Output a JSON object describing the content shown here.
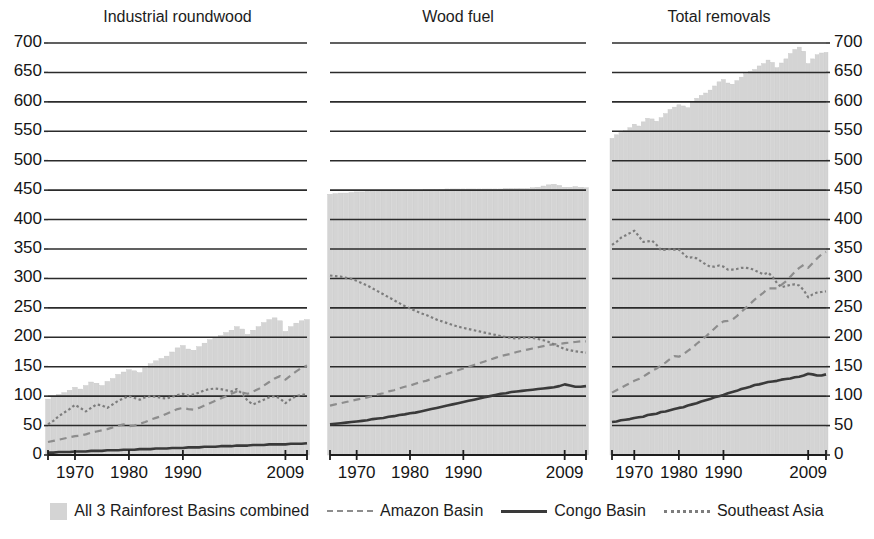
{
  "figure": {
    "width": 874,
    "height": 539,
    "background": "#ffffff"
  },
  "axes": {
    "y_ticks": [
      0,
      50,
      100,
      150,
      200,
      250,
      300,
      350,
      400,
      450,
      500,
      550,
      600,
      650,
      700
    ],
    "y_min": 0,
    "y_max": 700,
    "x_ticks": [
      "1970",
      "1980",
      "1990",
      "2009"
    ],
    "x_tick_years": [
      1970,
      1980,
      1990,
      2009
    ],
    "x_min": 1965,
    "x_max": 2013,
    "grid": true,
    "left_axis_shown": true,
    "right_axis_shown": true
  },
  "legend": {
    "position": "bottom-center",
    "items": [
      {
        "label": "All 3 Rainforest Basins combined",
        "marker": "area",
        "color": "#d4d4d4"
      },
      {
        "label": "Amazon Basin",
        "marker": "dashed",
        "color": "#8d8d8d"
      },
      {
        "label": "Congo Basin",
        "marker": "solid",
        "color": "#3a3a3a"
      },
      {
        "label": "Southeast Asia",
        "marker": "dotted",
        "color": "#7d7d7d"
      }
    ]
  },
  "chart_data": {
    "type": "line",
    "title": "",
    "xlabel": "",
    "ylabel": "",
    "ylim": [
      0,
      700
    ],
    "xlim": [
      1965,
      2013
    ],
    "grid": true,
    "legend_position": "bottom",
    "panels": [
      {
        "title": "Industrial roundwood",
        "x": [
          1965,
          1966,
          1967,
          1968,
          1969,
          1970,
          1971,
          1972,
          1973,
          1974,
          1975,
          1976,
          1977,
          1978,
          1979,
          1980,
          1981,
          1982,
          1983,
          1984,
          1985,
          1986,
          1987,
          1988,
          1989,
          1990,
          1991,
          1992,
          1993,
          1994,
          1995,
          1996,
          1997,
          1998,
          1999,
          2000,
          2001,
          2002,
          2003,
          2004,
          2005,
          2006,
          2007,
          2008,
          2009,
          2010,
          2011,
          2012,
          2013
        ],
        "series": [
          {
            "name": "All 3 Rainforest Basins combined",
            "type": "bar",
            "color": "#d4d4d4",
            "values": [
              95,
              100,
              103,
              106,
              110,
              115,
              112,
              118,
              124,
              122,
              118,
              125,
              130,
              137,
              141,
              145,
              143,
              140,
              148,
              155,
              160,
              164,
              168,
              175,
              182,
              186,
              180,
              178,
              184,
              190,
              196,
              200,
              203,
              208,
              212,
              218,
              214,
              205,
              212,
              218,
              225,
              230,
              233,
              228,
              210,
              218,
              224,
              228,
              230
            ]
          },
          {
            "name": "Amazon Basin",
            "type": "line",
            "style": "dashed",
            "color": "#8d8d8d",
            "values": [
              22,
              24,
              26,
              28,
              30,
              32,
              33,
              35,
              38,
              40,
              42,
              44,
              47,
              50,
              52,
              49,
              50,
              53,
              56,
              60,
              63,
              66,
              70,
              74,
              78,
              80,
              78,
              77,
              80,
              84,
              88,
              92,
              96,
              100,
              104,
              108,
              106,
              104,
              108,
              112,
              118,
              124,
              130,
              134,
              128,
              135,
              142,
              148,
              152
            ]
          },
          {
            "name": "Congo Basin",
            "type": "line",
            "style": "solid",
            "color": "#3a3a3a",
            "values": [
              4,
              4,
              5,
              5,
              5,
              6,
              6,
              6,
              7,
              7,
              7,
              8,
              8,
              8,
              9,
              9,
              9,
              10,
              10,
              10,
              11,
              11,
              11,
              12,
              12,
              12,
              13,
              13,
              13,
              14,
              14,
              14,
              15,
              15,
              15,
              16,
              16,
              16,
              17,
              17,
              17,
              18,
              18,
              18,
              18,
              19,
              19,
              19,
              20
            ]
          },
          {
            "name": "Southeast Asia",
            "type": "line",
            "style": "dotted",
            "color": "#7d7d7d",
            "values": [
              52,
              58,
              66,
              72,
              78,
              85,
              80,
              74,
              80,
              86,
              84,
              80,
              86,
              92,
              96,
              100,
              97,
              94,
              98,
              100,
              99,
              97,
              96,
              99,
              102,
              104,
              101,
              103,
              106,
              110,
              112,
              113,
              112,
              110,
              108,
              112,
              104,
              92,
              86,
              90,
              94,
              98,
              100,
              96,
              88,
              95,
              100,
              102,
              104
            ]
          }
        ]
      },
      {
        "title": "Wood fuel",
        "x": [
          1965,
          1966,
          1967,
          1968,
          1969,
          1970,
          1971,
          1972,
          1973,
          1974,
          1975,
          1976,
          1977,
          1978,
          1979,
          1980,
          1981,
          1982,
          1983,
          1984,
          1985,
          1986,
          1987,
          1988,
          1989,
          1990,
          1991,
          1992,
          1993,
          1994,
          1995,
          1996,
          1997,
          1998,
          1999,
          2000,
          2001,
          2002,
          2003,
          2004,
          2005,
          2006,
          2007,
          2008,
          2009,
          2010,
          2011,
          2012,
          2013
        ],
        "series": [
          {
            "name": "All 3 Rainforest Basins combined",
            "type": "bar",
            "color": "#d4d4d4",
            "values": [
              443,
              444,
              445,
              445,
              446,
              447,
              447,
              448,
              448,
              449,
              449,
              449,
              450,
              450,
              450,
              450,
              450,
              450,
              451,
              451,
              451,
              451,
              452,
              452,
              452,
              452,
              452,
              452,
              452,
              452,
              452,
              452,
              452,
              453,
              453,
              453,
              453,
              453,
              454,
              455,
              457,
              459,
              460,
              458,
              455,
              455,
              456,
              455,
              454
            ]
          },
          {
            "name": "Amazon Basin",
            "type": "line",
            "style": "dashed",
            "color": "#8d8d8d",
            "values": [
              84,
              86,
              88,
              90,
              92,
              94,
              96,
              98,
              100,
              103,
              105,
              108,
              110,
              113,
              116,
              118,
              121,
              124,
              126,
              129,
              132,
              135,
              138,
              141,
              144,
              147,
              150,
              153,
              156,
              159,
              162,
              165,
              168,
              170,
              172,
              175,
              177,
              179,
              181,
              183,
              185,
              187,
              188,
              189,
              190,
              191,
              192,
              193,
              193
            ]
          },
          {
            "name": "Congo Basin",
            "type": "line",
            "style": "solid",
            "color": "#3a3a3a",
            "values": [
              52,
              53,
              54,
              55,
              56,
              57,
              58,
              59,
              61,
              62,
              63,
              65,
              66,
              68,
              69,
              71,
              72,
              74,
              76,
              78,
              80,
              82,
              84,
              86,
              88,
              90,
              92,
              94,
              96,
              98,
              100,
              102,
              104,
              105,
              107,
              108,
              109,
              110,
              111,
              112,
              113,
              114,
              115,
              117,
              120,
              118,
              116,
              116,
              117
            ]
          },
          {
            "name": "Southeast Asia",
            "type": "line",
            "style": "dotted",
            "color": "#7d7d7d",
            "values": [
              305,
              304,
              303,
              301,
              299,
              296,
              292,
              288,
              283,
              278,
              273,
              268,
              263,
              258,
              253,
              249,
              245,
              241,
              238,
              234,
              230,
              227,
              224,
              221,
              218,
              216,
              214,
              212,
              210,
              208,
              206,
              204,
              202,
              200,
              199,
              198,
              199,
              200,
              199,
              197,
              195,
              192,
              188,
              184,
              180,
              178,
              176,
              175,
              174
            ]
          }
        ]
      },
      {
        "title": "Total removals",
        "x": [
          1965,
          1966,
          1967,
          1968,
          1969,
          1970,
          1971,
          1972,
          1973,
          1974,
          1975,
          1976,
          1977,
          1978,
          1979,
          1980,
          1981,
          1982,
          1983,
          1984,
          1985,
          1986,
          1987,
          1988,
          1989,
          1990,
          1991,
          1992,
          1993,
          1994,
          1995,
          1996,
          1997,
          1998,
          1999,
          2000,
          2001,
          2002,
          2003,
          2004,
          2005,
          2006,
          2007,
          2008,
          2009,
          2010,
          2011,
          2012,
          2013
        ],
        "series": [
          {
            "name": "All 3 Rainforest Basins combined",
            "type": "bar",
            "color": "#d4d4d4",
            "values": [
              538,
              544,
              548,
              551,
              556,
              562,
              559,
              566,
              572,
              571,
              567,
              573,
              580,
              587,
              591,
              595,
              593,
              590,
              599,
              606,
              611,
              615,
              620,
              627,
              634,
              638,
              632,
              630,
              636,
              642,
              648,
              652,
              655,
              661,
              665,
              671,
              667,
              658,
              666,
              673,
              682,
              689,
              693,
              686,
              665,
              673,
              680,
              683,
              684
            ]
          },
          {
            "name": "Amazon Basin",
            "type": "line",
            "style": "dashed",
            "color": "#8d8d8d",
            "values": [
              106,
              110,
              114,
              118,
              122,
              126,
              129,
              133,
              138,
              143,
              147,
              152,
              157,
              163,
              168,
              167,
              171,
              177,
              182,
              189,
              195,
              201,
              208,
              215,
              222,
              227,
              228,
              230,
              236,
              243,
              250,
              257,
              264,
              270,
              276,
              283,
              283,
              283,
              289,
              295,
              303,
              311,
              318,
              323,
              318,
              326,
              334,
              341,
              345
            ]
          },
          {
            "name": "Congo Basin",
            "type": "line",
            "style": "solid",
            "color": "#3a3a3a",
            "values": [
              56,
              57,
              59,
              60,
              61,
              63,
              64,
              65,
              68,
              69,
              70,
              73,
              74,
              76,
              78,
              80,
              81,
              84,
              86,
              88,
              91,
              93,
              95,
              98,
              100,
              102,
              105,
              107,
              109,
              112,
              114,
              116,
              119,
              120,
              122,
              124,
              125,
              126,
              128,
              129,
              130,
              132,
              133,
              135,
              138,
              137,
              135,
              135,
              137
            ]
          },
          {
            "name": "Southeast Asia",
            "type": "line",
            "style": "dotted",
            "color": "#7d7d7d",
            "values": [
              357,
              362,
              369,
              373,
              377,
              381,
              372,
              362,
              363,
              364,
              357,
              348,
              349,
              350,
              349,
              349,
              342,
              335,
              336,
              334,
              329,
              324,
              320,
              320,
              322,
              320,
              315,
              315,
              316,
              318,
              318,
              317,
              314,
              310,
              307,
              310,
              303,
              292,
              285,
              287,
              289,
              290,
              288,
              280,
              268,
              273,
              276,
              277,
              278
            ]
          }
        ]
      }
    ]
  }
}
